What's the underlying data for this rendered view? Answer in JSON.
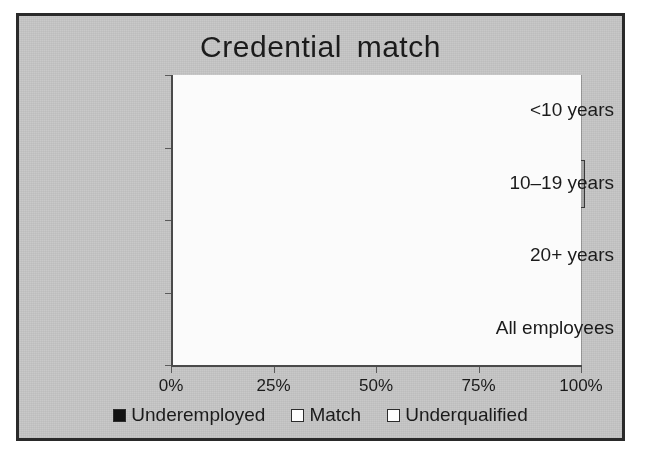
{
  "figure": {
    "title": "Credential match",
    "background_color": "#c9c9c9",
    "border_color": "#2a2a2a"
  },
  "chart_data": {
    "type": "bar",
    "orientation": "horizontal",
    "stacked": true,
    "stack_mode": "percent",
    "title": "Credential match",
    "xlabel": "",
    "ylabel": "",
    "xlim": [
      0,
      100
    ],
    "xticks": [
      0,
      25,
      50,
      75,
      100
    ],
    "xticklabels": [
      "0%",
      "25%",
      "50%",
      "75%",
      "100%"
    ],
    "grid": true,
    "legend_position": "bottom",
    "categories": [
      "<10 years",
      "10–19 years",
      "20+ years",
      "All employees"
    ],
    "series": [
      {
        "name": "Underemployed",
        "color": "#121212",
        "values": [
          23,
          37,
          52,
          34
        ]
      },
      {
        "name": "Match",
        "color": "#fdfdfd",
        "values": [
          56,
          51,
          43,
          51
        ]
      },
      {
        "name": "Underqualified",
        "color": "#a8a8a8",
        "values": [
          21,
          13,
          5,
          15
        ]
      }
    ],
    "data_labels": [
      [
        "23",
        "56",
        "21"
      ],
      [
        "37",
        "51",
        "13"
      ],
      [
        "52",
        "43",
        "5"
      ],
      [
        "34",
        "51",
        "15"
      ]
    ]
  },
  "legend": {
    "items": [
      {
        "label": "Underemployed",
        "swatch": "black-square-icon"
      },
      {
        "label": "Match",
        "swatch": "white-square-icon"
      },
      {
        "label": "Underqualified",
        "swatch": "white-square-icon"
      }
    ]
  }
}
